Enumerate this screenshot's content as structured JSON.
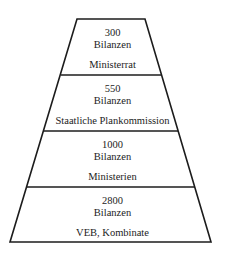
{
  "diagram": {
    "type": "pyramid",
    "stroke_color": "#1c1c1c",
    "background": "#ffffff",
    "tiers": [
      {
        "count": "300",
        "unit": "Bilanzen",
        "label": "Ministerrat"
      },
      {
        "count": "550",
        "unit": "Bilanzen",
        "label": "Staatliche Plankommission"
      },
      {
        "count": "1000",
        "unit": "Bilanzen",
        "label": "Ministerien"
      },
      {
        "count": "2800",
        "unit": "Bilanzen",
        "label": "VEB, Kombinate"
      }
    ]
  }
}
